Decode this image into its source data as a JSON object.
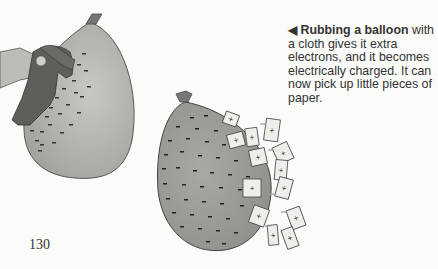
{
  "caption": {
    "arrow": "◀",
    "title": "Rubbing a balloon",
    "body": "with a cloth gives it extra electrons, and it becomes electrically charged. It can now pick up little pieces of paper."
  },
  "page_number": "130",
  "illustration": {
    "left_balloon": "balloon being rubbed with cloth by hand",
    "right_balloon": "charged balloon attracting paper pieces",
    "balloon_color": "#a8a8a2",
    "charge_symbol_balloon": "-",
    "charge_symbol_paper": "+"
  }
}
